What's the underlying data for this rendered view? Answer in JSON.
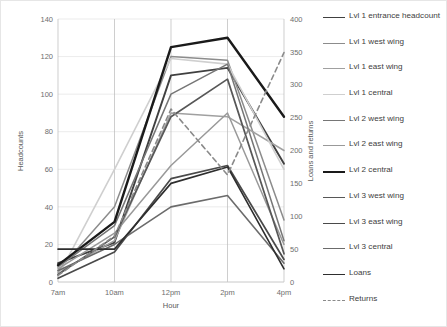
{
  "chart_data": {
    "type": "line",
    "title": "",
    "xlabel": "Hour",
    "ylabel": "Headcounts",
    "y2label": "Loans and returns",
    "categories": [
      "7am",
      "10am",
      "12pm",
      "2pm",
      "4pm"
    ],
    "ylim": [
      0,
      140
    ],
    "yticks": [
      0,
      20,
      40,
      60,
      80,
      100,
      120,
      140
    ],
    "y2lim": [
      0,
      400
    ],
    "y2ticks": [
      0,
      50,
      100,
      150,
      200,
      250,
      300,
      350,
      400
    ],
    "grid": true,
    "legend_position": "right",
    "series": [
      {
        "name": "Lvl 1 entrance headcount",
        "axis": "left",
        "color": "#404040",
        "width": 1.9,
        "dash": "none",
        "values": [
          10,
          21,
          110,
          114,
          63
        ]
      },
      {
        "name": "Lvl 1 west wing",
        "axis": "left",
        "color": "#8c8c8c",
        "width": 1.5,
        "dash": "none",
        "values": [
          6,
          40,
          120,
          118,
          33
        ]
      },
      {
        "name": "Lvl 1 east wing",
        "axis": "left",
        "color": "#a0a0a0",
        "width": 1.5,
        "dash": "none",
        "values": [
          5,
          22,
          90,
          88,
          70
        ]
      },
      {
        "name": "Lvl 1 central",
        "axis": "left",
        "color": "#cfcfcf",
        "width": 1.6,
        "dash": "none",
        "values": [
          3,
          60,
          119,
          116,
          60
        ]
      },
      {
        "name": "Lvl 2 west wing",
        "axis": "left",
        "color": "#767676",
        "width": 1.5,
        "dash": "none",
        "values": [
          8,
          30,
          100,
          116,
          22
        ]
      },
      {
        "name": "Lvl 2 east wing",
        "axis": "left",
        "color": "#999999",
        "width": 1.5,
        "dash": "none",
        "values": [
          7,
          26,
          62,
          90,
          20
        ]
      },
      {
        "name": "Lvl 2 central",
        "axis": "left",
        "color": "#1a1a1a",
        "width": 2.4,
        "dash": "none",
        "values": [
          9,
          32,
          125,
          130,
          88
        ]
      },
      {
        "name": "Lvl 3 west wing",
        "axis": "left",
        "color": "#575757",
        "width": 1.7,
        "dash": "none",
        "values": [
          4,
          24,
          88,
          108,
          15
        ]
      },
      {
        "name": "Lvl 3 east wing",
        "axis": "left",
        "color": "#4a4a4a",
        "width": 1.7,
        "dash": "none",
        "values": [
          2,
          16,
          55,
          62,
          12
        ]
      },
      {
        "name": "Lvl 3 central",
        "axis": "left",
        "color": "#6b6b6b",
        "width": 1.6,
        "dash": "none",
        "values": [
          6,
          20,
          40,
          46,
          10
        ]
      },
      {
        "name": "Loans",
        "axis": "right",
        "color": "#2e2e2e",
        "width": 1.6,
        "dash": "none",
        "values": [
          50,
          50,
          150,
          175,
          20
        ]
      },
      {
        "name": "Returns",
        "axis": "right",
        "color": "#8a8a8a",
        "width": 1.6,
        "dash": "dashed",
        "values": [
          10,
          70,
          263,
          163,
          349
        ]
      }
    ],
    "legend": [
      {
        "label": "Lvl 1 entrance headcount",
        "color": "#404040",
        "width": 1.9,
        "dash": "none"
      },
      {
        "label": "Lvl 1 west wing",
        "color": "#8c8c8c",
        "width": 1.5,
        "dash": "none"
      },
      {
        "label": "Lvl 1 east wing",
        "color": "#a0a0a0",
        "width": 1.5,
        "dash": "none"
      },
      {
        "label": "Lvl 1 central",
        "color": "#cfcfcf",
        "width": 1.6,
        "dash": "none"
      },
      {
        "label": "Lvl 2 west wing",
        "color": "#767676",
        "width": 1.5,
        "dash": "none"
      },
      {
        "label": "Lvl 2 east wing",
        "color": "#999999",
        "width": 1.5,
        "dash": "none"
      },
      {
        "label": "Lvl 2 central",
        "color": "#1a1a1a",
        "width": 2.4,
        "dash": "none"
      },
      {
        "label": "Lvl 3 west wing",
        "color": "#575757",
        "width": 1.7,
        "dash": "none"
      },
      {
        "label": "Lvl 3 east wing",
        "color": "#4a4a4a",
        "width": 1.7,
        "dash": "none"
      },
      {
        "label": "Lvl 3 central",
        "color": "#6b6b6b",
        "width": 1.6,
        "dash": "none"
      },
      {
        "label": "Loans",
        "color": "#2e2e2e",
        "width": 1.9,
        "dash": "none"
      },
      {
        "label": "Returns",
        "color": "#8a8a8a",
        "width": 1.6,
        "dash": "dashed"
      }
    ]
  }
}
